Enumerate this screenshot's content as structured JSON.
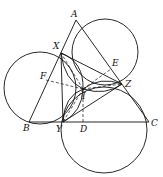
{
  "diagram": {
    "type": "geometry",
    "points": {
      "A": {
        "label": "A",
        "x": 76,
        "y": 20
      },
      "B": {
        "label": "B",
        "x": 29,
        "y": 122
      },
      "C": {
        "label": "C",
        "x": 149,
        "y": 122
      },
      "X": {
        "label": "X",
        "x": 61,
        "y": 53
      },
      "Y": {
        "label": "Y",
        "x": 63,
        "y": 122
      },
      "Z": {
        "label": "Z",
        "x": 122,
        "y": 84
      },
      "E": {
        "label": "E",
        "x": 111,
        "y": 69
      },
      "F": {
        "label": "F",
        "x": 46,
        "y": 80
      },
      "D": {
        "label": "D",
        "x": 83,
        "y": 122
      },
      "I": {
        "label": "I",
        "x": 83,
        "y": 89
      }
    },
    "circles": [
      {
        "name": "circle-AXZ",
        "cx": 105,
        "cy": 52,
        "r": 33
      },
      {
        "name": "circle-BXY",
        "cx": 40,
        "cy": 88,
        "r": 36
      },
      {
        "name": "circle-CYZ",
        "cx": 104,
        "cy": 130,
        "r": 43
      }
    ]
  }
}
